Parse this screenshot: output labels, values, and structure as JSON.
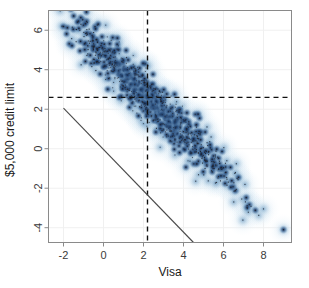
{
  "chart_data": {
    "type": "scatter",
    "title": "",
    "subtitle": "",
    "xlabel": "Visa",
    "ylabel": "$5,000 credit limit",
    "xlim": [
      -2.75,
      9.4
    ],
    "ylim": [
      -4.75,
      7.0
    ],
    "xticks": [
      -2,
      0,
      2,
      4,
      6,
      8
    ],
    "xtick_labels": [
      "-2",
      "0",
      "2",
      "4",
      "6",
      "8"
    ],
    "yticks": [
      6,
      4,
      2,
      0,
      -2,
      -4
    ],
    "ytick_labels": [
      "6",
      "4",
      "2",
      "0",
      "-2",
      "-4"
    ],
    "grid": true,
    "grid_color": "#f0f0f0",
    "legend": "none",
    "frame_color": "#7a7a7a",
    "density_shading": true,
    "density_colors": [
      "#ffffff",
      "#e8f0f7",
      "#c6daea",
      "#93b8d6",
      "#4f7fad",
      "#1d3a63",
      "#14284a"
    ],
    "point_color": "#20222b",
    "reference_lines": [
      {
        "name": "vertical-mean-line",
        "orientation": "vertical",
        "x": 2.2,
        "style": "dashed",
        "color": "#111111"
      },
      {
        "name": "horizontal-mean-line",
        "orientation": "horizontal",
        "y": 2.6,
        "style": "dashed",
        "color": "#111111"
      },
      {
        "name": "budget-constraint-line",
        "orientation": "diagonal",
        "x0": -2.0,
        "y0": 2.05,
        "x1": 4.5,
        "y1": -4.75,
        "style": "solid",
        "color": "#4a4a4a"
      }
    ],
    "correlation": "strong negative",
    "n_points": 1100,
    "cloud": {
      "center_x": 2.2,
      "center_y": 2.6,
      "slope": -1.03,
      "spread_along": 2.75,
      "spread_across": 0.42,
      "x_min": -1.8,
      "x_max": 9.0
    },
    "outliers": [
      {
        "x": 6.75,
        "y": -1.45
      },
      {
        "x": 8.0,
        "y": -3.05
      },
      {
        "x": 9.0,
        "y": -4.1
      },
      {
        "x": 6.1,
        "y": -1.2
      },
      {
        "x": 5.9,
        "y": -0.95
      }
    ],
    "series": [
      {
        "name": "visa-vs-credit-limit",
        "marker": "dot",
        "marker_size": 1,
        "x": [
          -1.55,
          -1.45,
          -1.38,
          -1.3,
          -1.22,
          -1.15,
          -1.1,
          -1.02,
          -0.95,
          -0.88,
          -0.8,
          -0.72,
          -0.65,
          -0.58,
          -0.5,
          -0.42,
          -0.35,
          -0.28,
          -0.2,
          -0.12,
          -0.05,
          0.02,
          0.1,
          0.18,
          0.25,
          0.32,
          0.4,
          0.48,
          0.55,
          0.62,
          0.7,
          0.78,
          0.85,
          0.92,
          1.0,
          1.08,
          1.15,
          1.22,
          1.3,
          1.38,
          1.45,
          1.52,
          1.6,
          1.68,
          1.75,
          1.82,
          1.9,
          1.98,
          2.05,
          2.12,
          2.2,
          2.28,
          2.35,
          2.42,
          2.5,
          2.58,
          2.65,
          2.72,
          2.8,
          2.88,
          2.95,
          3.02,
          3.1,
          3.18,
          3.25,
          3.32,
          3.4,
          3.48,
          3.55,
          3.62,
          3.7,
          3.78,
          3.85,
          3.92,
          4.0,
          4.1,
          4.2,
          4.3,
          4.4,
          4.5,
          4.6,
          4.7,
          4.8,
          4.9,
          5.0,
          5.1,
          5.2,
          5.3,
          5.45,
          5.6,
          5.75,
          5.9,
          6.05,
          6.2,
          6.4,
          6.75,
          8.0,
          9.0
        ],
        "y": [
          6.35,
          6.2,
          6.1,
          6.05,
          5.95,
          5.85,
          5.8,
          5.7,
          5.65,
          5.55,
          5.5,
          5.4,
          5.3,
          5.25,
          5.15,
          5.1,
          5.0,
          4.95,
          4.85,
          4.75,
          4.7,
          4.6,
          4.55,
          4.45,
          4.4,
          4.3,
          4.2,
          4.15,
          4.05,
          4.0,
          3.9,
          3.85,
          3.75,
          3.65,
          3.6,
          3.5,
          3.45,
          3.35,
          3.3,
          3.2,
          3.1,
          3.05,
          2.95,
          2.9,
          2.8,
          2.75,
          2.65,
          2.55,
          2.5,
          2.4,
          2.6,
          2.25,
          2.2,
          2.1,
          2.0,
          1.95,
          1.85,
          1.8,
          1.7,
          1.6,
          1.55,
          1.45,
          1.4,
          1.3,
          1.25,
          1.15,
          1.05,
          1.0,
          0.9,
          0.85,
          0.75,
          0.7,
          0.6,
          0.5,
          0.45,
          0.35,
          0.25,
          0.15,
          0.05,
          -0.05,
          -0.15,
          -0.25,
          -0.35,
          -0.45,
          -0.55,
          -0.65,
          -0.75,
          -0.85,
          -0.95,
          -1.05,
          -1.1,
          -0.95,
          -1.2,
          -1.25,
          -1.35,
          -1.45,
          -3.05,
          -4.1
        ]
      }
    ]
  }
}
